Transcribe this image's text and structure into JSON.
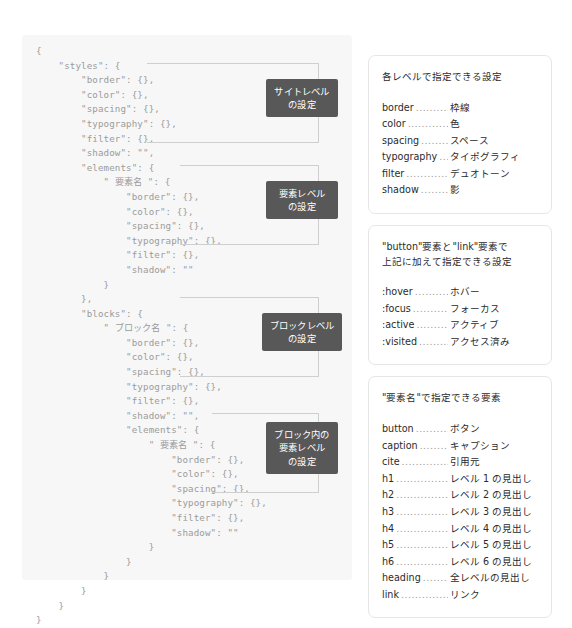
{
  "code_panel": {
    "language": "json",
    "listing": "{\n    \"styles\": {\n        \"border\": {},\n        \"color\": {},\n        \"spacing\": {},\n        \"typography\": {},\n        \"filter\": {},\n        \"shadow\": \"\",\n        \"elements\": {\n            \" 要素名 \": {\n                \"border\": {},\n                \"color\": {},\n                \"spacing\": {},\n                \"typography\": {},\n                \"filter\": {},\n                \"shadow\": \"\"\n            }\n        },\n        \"blocks\": {\n            \" ブロック名 \": {\n                \"border\": {},\n                \"color\": {},\n                \"spacing\": {},\n                \"typography\": {},\n                \"filter\": {},\n                \"shadow\": \"\",\n                \"elements\": {\n                    \" 要素名 \": {\n                        \"border\": {},\n                        \"color\": {},\n                        \"spacing\": {},\n                        \"typography\": {},\n                        \"filter\": {},\n                        \"shadow\": \"\"\n                    }\n                }\n            }\n        }\n    }\n}"
  },
  "annotations": [
    {
      "id": "site-level",
      "label": "サイトレベル\nの設定"
    },
    {
      "id": "element-level",
      "label": "要素レベル\nの設定"
    },
    {
      "id": "block-level",
      "label": "ブロックレベル\nの設定"
    },
    {
      "id": "block-element-level",
      "label": "ブロック内の\n要素レベル\nの設定"
    }
  ],
  "reference_cards": [
    {
      "title": "各レベルで指定できる設定",
      "rows": [
        {
          "term": "border",
          "definition": "枠線"
        },
        {
          "term": "color",
          "definition": "色"
        },
        {
          "term": "spacing",
          "definition": "スペース"
        },
        {
          "term": "typography",
          "definition": "タイポグラフィ"
        },
        {
          "term": "filter",
          "definition": "デュオトーン"
        },
        {
          "term": "shadow",
          "definition": "影"
        }
      ]
    },
    {
      "title": "\"button\"要素と\"link\"要素で\n上記に加えて指定できる設定",
      "rows": [
        {
          "term": ":hover",
          "definition": "ホバー"
        },
        {
          "term": ":focus",
          "definition": "フォーカス"
        },
        {
          "term": ":active",
          "definition": "アクティブ"
        },
        {
          "term": ":visited",
          "definition": "アクセス済み"
        }
      ]
    },
    {
      "title": "\"要素名\"で指定できる要素",
      "rows": [
        {
          "term": "button",
          "definition": "ボタン"
        },
        {
          "term": "caption",
          "definition": "キャプション"
        },
        {
          "term": "cite",
          "definition": "引用元"
        },
        {
          "term": "h1",
          "definition": "レベル 1 の見出し"
        },
        {
          "term": "h2",
          "definition": "レベル 2 の見出し"
        },
        {
          "term": "h3",
          "definition": "レベル 3 の見出し"
        },
        {
          "term": "h4",
          "definition": "レベル 4 の見出し"
        },
        {
          "term": "h5",
          "definition": "レベル 5 の見出し"
        },
        {
          "term": "h6",
          "definition": "レベル 6 の見出し"
        },
        {
          "term": "heading",
          "definition": "全レベルの見出し"
        },
        {
          "term": "link",
          "definition": "リンク"
        }
      ]
    }
  ],
  "colors": {
    "code_background": "#f7f7f7",
    "code_text": "#9b9b9b",
    "label_background": "#585858",
    "label_text": "#ffffff",
    "connector_line": "#cfcfcf",
    "card_border": "#e6e6e6",
    "body_text": "#2b2b2b",
    "page_background": "#ffffff"
  },
  "dot_leader": "............................................."
}
